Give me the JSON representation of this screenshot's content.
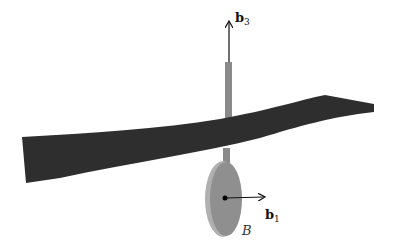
{
  "diagram": {
    "labels": {
      "b3_main": "b",
      "b3_sub": "3",
      "b1_main": "b",
      "b1_sub": "1",
      "body": "B"
    },
    "colors": {
      "strip": "#2e2e2e",
      "rod": "#8a8a8a",
      "disc": "#8f8f8f",
      "disc_edge": "#b0b0b0",
      "arrow": "#111111",
      "dot": "#000000",
      "background": "#ffffff"
    }
  }
}
